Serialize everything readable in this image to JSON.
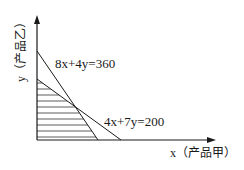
{
  "diagram": {
    "type": "linear-programming-feasible-region",
    "x_axis_label": "x（产品甲）",
    "x_axis_var": "x",
    "x_axis_text": "（产品甲）",
    "y_axis_label": "y（产品乙）",
    "y_axis_var": "y",
    "y_axis_text": "（产品乙）",
    "constraints": [
      {
        "label": "8x+4y=360",
        "coef_x": 8,
        "coef_y": 4,
        "rhs": 360
      },
      {
        "label": "4x+7y=200",
        "coef_x": 4,
        "coef_y": 7,
        "rhs": 200
      }
    ],
    "shading": "horizontal hatch lines for feasible region",
    "colors": {
      "line": "#1a1a1a",
      "background": "#ffffff"
    }
  }
}
